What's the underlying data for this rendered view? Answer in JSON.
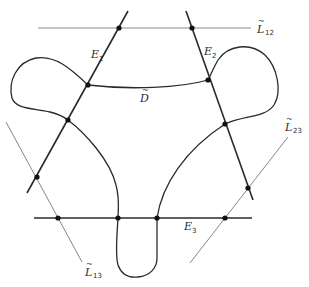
{
  "figure": {
    "colors": {
      "background": "#ffffff",
      "curve": "#2a2a2a",
      "exceptional_line": "#2a2a2a",
      "thin_line": "#777777",
      "point": "#111111"
    },
    "labels": {
      "E1": {
        "main": "E",
        "sub": "1"
      },
      "E2": {
        "main": "E",
        "sub": "2"
      },
      "E3": {
        "main": "E",
        "sub": "3"
      },
      "D": {
        "main": "D",
        "tilde": "~"
      },
      "L12": {
        "main": "L",
        "sub": "12",
        "tilde": "~"
      },
      "L13": {
        "main": "L",
        "sub": "13",
        "tilde": "~"
      },
      "L23": {
        "main": "L",
        "sub": "23",
        "tilde": "~"
      }
    }
  }
}
